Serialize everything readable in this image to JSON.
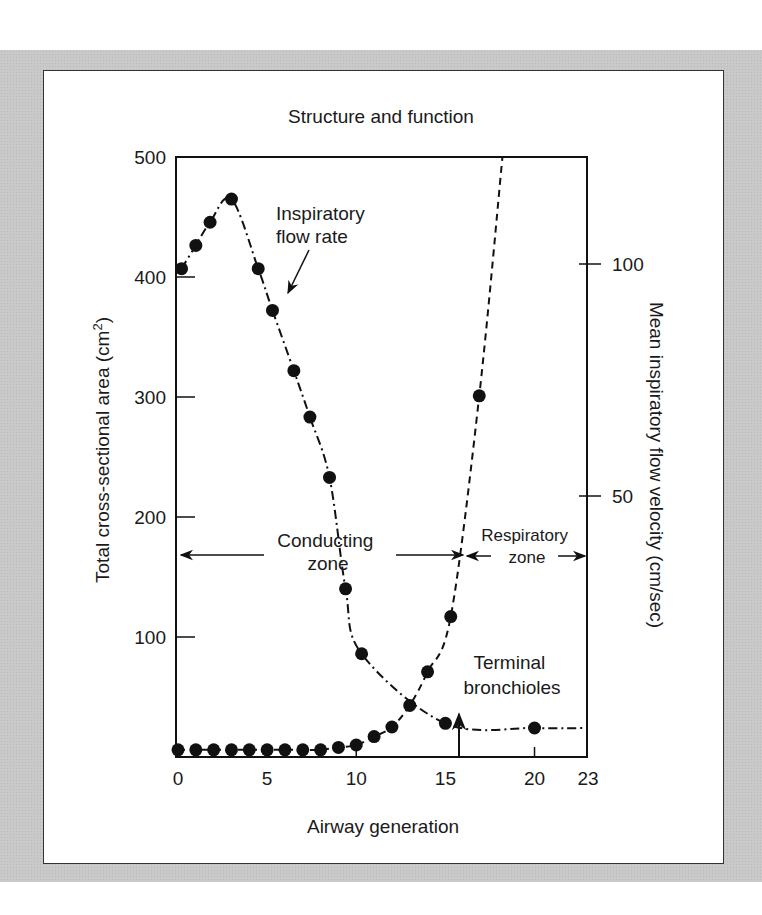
{
  "chart_data": {
    "type": "line",
    "title": "Structure and function",
    "xlabel": "Airway generation",
    "ylabel_left": "Total cross-sectional area (cm²)",
    "ylabel_left_parts": {
      "main": "Total cross-sectional area (cm",
      "sup": "2",
      "end": ")"
    },
    "ylabel_right": "Mean inspiratory flow velocity (cm/sec)",
    "xlim": [
      0,
      23
    ],
    "ylim_left": [
      0,
      500
    ],
    "ylim_right": [
      0,
      115.5
    ],
    "x_ticks": [
      0,
      5,
      10,
      15,
      20,
      23
    ],
    "y_ticks_left": [
      100,
      200,
      300,
      400,
      500
    ],
    "y_ticks_right": [
      50,
      100
    ],
    "grid": false,
    "series": [
      {
        "name": "Total cross-sectional area",
        "axis": "left",
        "line_style": "dashed",
        "points": [
          {
            "x": 0,
            "y": 6
          },
          {
            "x": 1,
            "y": 6
          },
          {
            "x": 2,
            "y": 6
          },
          {
            "x": 3,
            "y": 6
          },
          {
            "x": 4,
            "y": 6
          },
          {
            "x": 5,
            "y": 6
          },
          {
            "x": 6,
            "y": 6
          },
          {
            "x": 7,
            "y": 6
          },
          {
            "x": 8,
            "y": 6
          },
          {
            "x": 9,
            "y": 8
          },
          {
            "x": 10,
            "y": 10
          },
          {
            "x": 11,
            "y": 17
          },
          {
            "x": 12,
            "y": 25
          },
          {
            "x": 13,
            "y": 43
          },
          {
            "x": 14,
            "y": 71
          },
          {
            "x": 15.3,
            "y": 117
          },
          {
            "x": 16.9,
            "y": 301
          }
        ],
        "curve_extends_to": {
          "x": 18.2,
          "y": 500
        }
      },
      {
        "name": "Inspiratory flow rate",
        "axis": "right",
        "line_style": "dash-dot",
        "points": [
          {
            "x": 0.2,
            "y": 99
          },
          {
            "x": 1,
            "y": 104
          },
          {
            "x": 1.8,
            "y": 109
          },
          {
            "x": 3,
            "y": 114
          },
          {
            "x": 4.5,
            "y": 99
          },
          {
            "x": 5.3,
            "y": 90
          },
          {
            "x": 6.5,
            "y": 77
          },
          {
            "x": 7.4,
            "y": 67
          },
          {
            "x": 8.5,
            "y": 54
          },
          {
            "x": 9.4,
            "y": 30
          },
          {
            "x": 10.3,
            "y": 16
          },
          {
            "x": 15,
            "y": 1
          },
          {
            "x": 20,
            "y": 0
          }
        ],
        "curve_extends_to": {
          "x": 23,
          "y": 0
        }
      }
    ],
    "annotations": [
      {
        "id": "flow-rate-label",
        "lines": [
          "Inspiratory",
          "flow rate"
        ],
        "arrow_to_series": "Inspiratory flow rate"
      },
      {
        "id": "conducting-zone",
        "lines": [
          "Conducting",
          "zone"
        ],
        "x_range": [
          0,
          16
        ]
      },
      {
        "id": "respiratory-zone",
        "lines": [
          "Respiratory",
          "zone"
        ],
        "x_range": [
          16,
          23
        ]
      },
      {
        "id": "terminal-bronchioles",
        "lines": [
          "Terminal",
          "bronchioles"
        ],
        "arrow_at_x": 16
      }
    ]
  }
}
